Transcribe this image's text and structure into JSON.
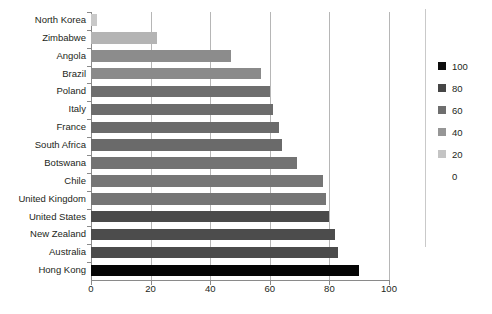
{
  "chart_data": {
    "type": "bar",
    "orientation": "horizontal",
    "title": "",
    "xlabel": "",
    "ylabel": "",
    "xlim": [
      0,
      100
    ],
    "xticks": [
      0,
      20,
      40,
      60,
      80,
      100
    ],
    "grid": true,
    "categories": [
      "North Korea",
      "Zimbabwe",
      "Angola",
      "Brazil",
      "Poland",
      "Italy",
      "France",
      "South Africa",
      "Botswana",
      "Chile",
      "United Kingdom",
      "United States",
      "New Zealand",
      "Australia",
      "Hong Kong"
    ],
    "values": [
      2,
      22,
      47,
      57,
      60,
      61,
      63,
      64,
      69,
      78,
      79,
      80,
      82,
      83,
      90
    ],
    "bar_colors": [
      "#c9c9c9",
      "#b4b4b4",
      "#8c8c8c",
      "#8a8a8a",
      "#6e6e6e",
      "#6c6c6c",
      "#6b6b6b",
      "#6a6a6a",
      "#737373",
      "#767676",
      "#757575",
      "#4a4a4a",
      "#4c4c4c",
      "#4b4b4b",
      "#050505"
    ],
    "legend": {
      "position": "right",
      "entries": [
        {
          "label": "100",
          "color": "#0d0d0d",
          "has_swatch": true
        },
        {
          "label": "80",
          "color": "#464646",
          "has_swatch": true
        },
        {
          "label": "60",
          "color": "#6e6e6e",
          "has_swatch": true
        },
        {
          "label": "40",
          "color": "#969696",
          "has_swatch": true
        },
        {
          "label": "20",
          "color": "#c4c4c4",
          "has_swatch": true
        },
        {
          "label": "0",
          "color": "#ffffff",
          "has_swatch": false
        }
      ]
    }
  }
}
